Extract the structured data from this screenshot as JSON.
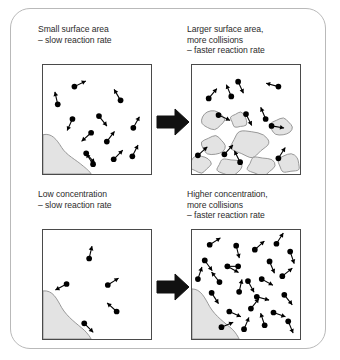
{
  "figure": {
    "frame_border_color": "#b9b9b9",
    "panel_border_color": "#4a4a4a",
    "solid_fill_color": "#e3e3e3",
    "solid_outline_color": "#8c8c8c",
    "particle_color": "#000000",
    "text_color": "#2b2b2b",
    "arrow_color": "#111111"
  },
  "captions": {
    "top_left": "Small surface area\n– slow reaction rate",
    "top_right": "Larger surface area,\nmore collisions\n– faster reaction rate",
    "bottom_left": "Low concentration\n– slow reaction rate",
    "bottom_right": "Higher concentration,\nmore collisions\n– faster reaction rate"
  },
  "panels": {
    "top_left": {
      "name": "small-surface-area-panel",
      "solid_shape": "single large lump in lower-left corner",
      "particle_count": 12,
      "blob_count": 0,
      "particles": [
        {
          "x": 32,
          "y": 22,
          "dx": 12,
          "dy": -6
        },
        {
          "x": 15,
          "y": 40,
          "dx": -3,
          "dy": -13
        },
        {
          "x": 30,
          "y": 55,
          "dx": -5,
          "dy": 11
        },
        {
          "x": 57,
          "y": 52,
          "dx": 8,
          "dy": 10
        },
        {
          "x": 49,
          "y": 69,
          "dx": -10,
          "dy": 9
        },
        {
          "x": 79,
          "y": 36,
          "dx": -7,
          "dy": -12
        },
        {
          "x": 65,
          "y": 78,
          "dx": 9,
          "dy": -12
        },
        {
          "x": 92,
          "y": 64,
          "dx": 6,
          "dy": -11
        },
        {
          "x": 91,
          "y": 93,
          "dx": 6,
          "dy": -12
        },
        {
          "x": 72,
          "y": 96,
          "dx": 9,
          "dy": -9
        },
        {
          "x": 51,
          "y": 101,
          "dx": -7,
          "dy": -11
        },
        {
          "x": 44,
          "y": 90,
          "dx": 9,
          "dy": 10
        }
      ]
    },
    "top_right": {
      "name": "larger-surface-area-panel",
      "solid_shape": "many small broken lumps spread across lower half",
      "particle_count": 12,
      "blob_count": 9,
      "blobs": [
        {
          "cx": 21,
          "cy": 56,
          "rx": 12,
          "ry": 10
        },
        {
          "cx": 48,
          "cy": 56,
          "rx": 9,
          "ry": 8
        },
        {
          "cx": 22,
          "cy": 82,
          "rx": 13,
          "ry": 10
        },
        {
          "cx": 58,
          "cy": 80,
          "rx": 19,
          "ry": 14
        },
        {
          "cx": 91,
          "cy": 63,
          "rx": 12,
          "ry": 9
        },
        {
          "cx": 8,
          "cy": 101,
          "rx": 11,
          "ry": 9
        },
        {
          "cx": 38,
          "cy": 104,
          "rx": 13,
          "ry": 9
        },
        {
          "cx": 70,
          "cy": 103,
          "rx": 14,
          "ry": 10
        },
        {
          "cx": 99,
          "cy": 100,
          "rx": 12,
          "ry": 10
        }
      ],
      "particles": [
        {
          "x": 47,
          "y": 17,
          "dx": 5,
          "dy": 11
        },
        {
          "x": 17,
          "y": 34,
          "dx": 10,
          "dy": -12
        },
        {
          "x": 40,
          "y": 32,
          "dx": -5,
          "dy": -12
        },
        {
          "x": 88,
          "y": 22,
          "dx": -11,
          "dy": -3
        },
        {
          "x": 27,
          "y": 51,
          "dx": 11,
          "dy": 5
        },
        {
          "x": 55,
          "y": 50,
          "dx": 6,
          "dy": 12
        },
        {
          "x": 75,
          "y": 55,
          "dx": -5,
          "dy": -12
        },
        {
          "x": 81,
          "y": 62,
          "dx": 12,
          "dy": 2
        },
        {
          "x": 6,
          "y": 92,
          "dx": 11,
          "dy": -10
        },
        {
          "x": 33,
          "y": 91,
          "dx": 10,
          "dy": -11
        },
        {
          "x": 49,
          "y": 99,
          "dx": -6,
          "dy": -12
        },
        {
          "x": 88,
          "y": 95,
          "dx": 7,
          "dy": -11
        }
      ]
    },
    "bottom_left": {
      "name": "low-concentration-panel",
      "solid_shape": "single large lump in lower-left corner",
      "particle_count": 5,
      "blob_count": 0,
      "particles": [
        {
          "x": 47,
          "y": 29,
          "dx": 3,
          "dy": -13
        },
        {
          "x": 24,
          "y": 55,
          "dx": -11,
          "dy": 6
        },
        {
          "x": 66,
          "y": 56,
          "dx": 11,
          "dy": -7
        },
        {
          "x": 75,
          "y": 83,
          "dx": -10,
          "dy": -9
        },
        {
          "x": 42,
          "y": 95,
          "dx": 8,
          "dy": 8
        }
      ]
    },
    "bottom_right": {
      "name": "higher-concentration-panel",
      "solid_shape": "single large lump in lower-left corner",
      "particle_count": 25,
      "blob_count": 0,
      "particles": [
        {
          "x": 18,
          "y": 15,
          "dx": 11,
          "dy": -7
        },
        {
          "x": 45,
          "y": 16,
          "dx": 3,
          "dy": 12
        },
        {
          "x": 64,
          "y": 20,
          "dx": 10,
          "dy": -9
        },
        {
          "x": 86,
          "y": 14,
          "dx": 7,
          "dy": -11
        },
        {
          "x": 100,
          "y": 22,
          "dx": 4,
          "dy": 12
        },
        {
          "x": 13,
          "y": 31,
          "dx": 8,
          "dy": 11
        },
        {
          "x": 36,
          "y": 37,
          "dx": 11,
          "dy": 6
        },
        {
          "x": 47,
          "y": 37,
          "dx": -13,
          "dy": 0
        },
        {
          "x": 79,
          "y": 32,
          "dx": 5,
          "dy": 12
        },
        {
          "x": 6,
          "y": 50,
          "dx": 4,
          "dy": -12
        },
        {
          "x": 28,
          "y": 53,
          "dx": -8,
          "dy": -10
        },
        {
          "x": 57,
          "y": 52,
          "dx": 6,
          "dy": 11
        },
        {
          "x": 71,
          "y": 50,
          "dx": 11,
          "dy": 6
        },
        {
          "x": 92,
          "y": 47,
          "dx": 10,
          "dy": -8
        },
        {
          "x": 20,
          "y": 64,
          "dx": 7,
          "dy": 11
        },
        {
          "x": 48,
          "y": 63,
          "dx": 3,
          "dy": -13
        },
        {
          "x": 66,
          "y": 68,
          "dx": 11,
          "dy": 3
        },
        {
          "x": 94,
          "y": 66,
          "dx": 8,
          "dy": 10
        },
        {
          "x": 38,
          "y": 83,
          "dx": 11,
          "dy": 5
        },
        {
          "x": 60,
          "y": 80,
          "dx": 8,
          "dy": -10
        },
        {
          "x": 83,
          "y": 84,
          "dx": 11,
          "dy": 4
        },
        {
          "x": 30,
          "y": 99,
          "dx": 12,
          "dy": -5
        },
        {
          "x": 53,
          "y": 101,
          "dx": 5,
          "dy": -12
        },
        {
          "x": 74,
          "y": 97,
          "dx": -4,
          "dy": -12
        },
        {
          "x": 98,
          "y": 93,
          "dx": 5,
          "dy": 12
        }
      ]
    }
  },
  "arrows": {
    "top": {
      "name": "transition-arrow-top",
      "direction": "right"
    },
    "bottom": {
      "name": "transition-arrow-bottom",
      "direction": "right"
    }
  }
}
